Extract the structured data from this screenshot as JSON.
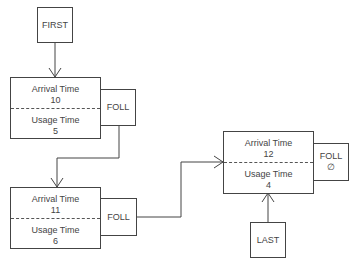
{
  "first_pointer": {
    "label": "FIRST"
  },
  "last_pointer": {
    "label": "LAST"
  },
  "nodes": [
    {
      "arrival_label": "Arrival Time",
      "arrival_value": "10",
      "usage_label": "Usage Time",
      "usage_value": "5",
      "foll_label": "FOLL",
      "foll_value": ""
    },
    {
      "arrival_label": "Arrival Time",
      "arrival_value": "11",
      "usage_label": "Usage Time",
      "usage_value": "6",
      "foll_label": "FOLL",
      "foll_value": ""
    },
    {
      "arrival_label": "Arrival Time",
      "arrival_value": "12",
      "usage_label": "Usage Time",
      "usage_value": "4",
      "foll_label": "FOLL",
      "foll_value": "∅"
    }
  ],
  "colors": {
    "line": "#444444",
    "background": "#ffffff"
  }
}
